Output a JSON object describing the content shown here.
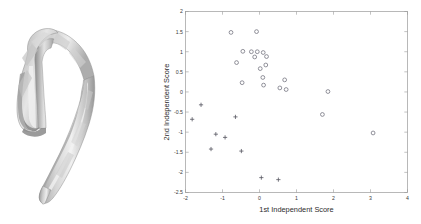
{
  "figure": {
    "background_color": "#ffffff",
    "panels": [
      "bone-render",
      "scatter-plot"
    ]
  },
  "bone_render": {
    "name": "3d-bone-model",
    "description": "hook-shaped 3D rendered bone surface mesh",
    "shading": "faceted grayscale polygonal mesh",
    "colors": {
      "highlight": "#f2f2f2",
      "light": "#dcdcdc",
      "mid": "#bdbdbd",
      "shadow": "#9a9a9a",
      "dark": "#7c7c7c",
      "outline": "#8f8f8f"
    }
  },
  "chart_data": {
    "type": "scatter",
    "title": "",
    "xlabel": "1st Independent Score",
    "ylabel": "2nd Independent Score",
    "xlim": [
      -2,
      4
    ],
    "ylim": [
      -2.5,
      2
    ],
    "xticks": [
      -2,
      -1,
      0,
      1,
      2,
      3,
      4
    ],
    "xtick_labels": [
      "-2",
      "-1",
      "0",
      "1",
      "2",
      "3",
      "4"
    ],
    "yticks": [
      -2.5,
      -2,
      -1.5,
      -1,
      -0.5,
      0,
      0.5,
      1,
      1.5,
      2
    ],
    "ytick_labels": [
      "-2.5",
      "-2",
      "-1.5",
      "-1",
      "-0.5",
      "0",
      "0.5",
      "1",
      "1.5",
      "2"
    ],
    "grid": false,
    "legend": null,
    "legend_position": "none",
    "series": [
      {
        "name": "Group 1",
        "marker": "circle",
        "color": "#6e6e7a",
        "points": [
          [
            -0.77,
            1.48
          ],
          [
            -0.08,
            1.5
          ],
          [
            -0.62,
            0.73
          ],
          [
            -0.45,
            1.01
          ],
          [
            -0.22,
            1.0
          ],
          [
            -0.06,
            1.0
          ],
          [
            -0.13,
            0.87
          ],
          [
            0.1,
            0.98
          ],
          [
            0.19,
            0.88
          ],
          [
            -0.47,
            0.23
          ],
          [
            0.02,
            0.58
          ],
          [
            0.17,
            0.67
          ],
          [
            0.09,
            0.36
          ],
          [
            0.11,
            0.17
          ],
          [
            0.68,
            0.3
          ],
          [
            0.55,
            0.1
          ],
          [
            0.72,
            0.06
          ],
          [
            1.85,
            0.01
          ],
          [
            1.7,
            -0.56
          ],
          [
            3.07,
            -1.02
          ]
        ]
      },
      {
        "name": "Group 2",
        "marker": "plus",
        "color": "#55555f",
        "points": [
          [
            -1.58,
            -0.32
          ],
          [
            -1.82,
            -0.68
          ],
          [
            -0.65,
            -0.62
          ],
          [
            -1.18,
            -1.05
          ],
          [
            -0.93,
            -1.13
          ],
          [
            -1.31,
            -1.42
          ],
          [
            -0.49,
            -1.47
          ],
          [
            0.05,
            -2.13
          ],
          [
            0.51,
            -2.18
          ]
        ]
      }
    ]
  }
}
